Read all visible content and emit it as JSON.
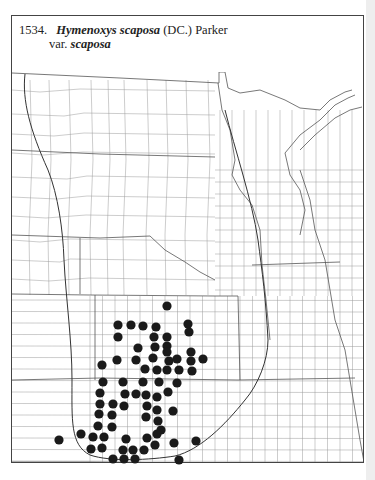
{
  "caption": {
    "number": "1534.",
    "genus": "Hymenoxys",
    "epithet": "scaposa",
    "authority": "(DC.) Parker",
    "rank": "var.",
    "infraspecific": "scaposa"
  },
  "colors": {
    "ink": "#222222",
    "county_line": "#9a9a9a",
    "state_line": "#555555",
    "range_line": "#333333",
    "dot": "#1a1a1a",
    "gutter": "#eeeeee"
  },
  "map": {
    "frame": {
      "x": 11,
      "y": 15,
      "width": 353,
      "height": 448
    },
    "dot_radius": 4.6,
    "occurrence_dots": [
      [
        167,
        306
      ],
      [
        118,
        325
      ],
      [
        131,
        325
      ],
      [
        143,
        326
      ],
      [
        156,
        327
      ],
      [
        188,
        324
      ],
      [
        189,
        332
      ],
      [
        118,
        337
      ],
      [
        154,
        337
      ],
      [
        167,
        337
      ],
      [
        138,
        348
      ],
      [
        155,
        347
      ],
      [
        167,
        346
      ],
      [
        167,
        352
      ],
      [
        191,
        352
      ],
      [
        117,
        360
      ],
      [
        136,
        360
      ],
      [
        153,
        358
      ],
      [
        169,
        361
      ],
      [
        177,
        359
      ],
      [
        191,
        361
      ],
      [
        203,
        359
      ],
      [
        102,
        365
      ],
      [
        145,
        369
      ],
      [
        157,
        370
      ],
      [
        167,
        370
      ],
      [
        179,
        370
      ],
      [
        192,
        371
      ],
      [
        103,
        382
      ],
      [
        123,
        382
      ],
      [
        143,
        382
      ],
      [
        159,
        382
      ],
      [
        177,
        383
      ],
      [
        100,
        393
      ],
      [
        125,
        394
      ],
      [
        136,
        394
      ],
      [
        146,
        395
      ],
      [
        157,
        397
      ],
      [
        168,
        392
      ],
      [
        100,
        404
      ],
      [
        113,
        404
      ],
      [
        124,
        406
      ],
      [
        147,
        406
      ],
      [
        157,
        410
      ],
      [
        173,
        411
      ],
      [
        99,
        414
      ],
      [
        112,
        415
      ],
      [
        146,
        417
      ],
      [
        158,
        421
      ],
      [
        98,
        426
      ],
      [
        112,
        427
      ],
      [
        161,
        430
      ],
      [
        157,
        434
      ],
      [
        59,
        440
      ],
      [
        81,
        434
      ],
      [
        93,
        437
      ],
      [
        104,
        437
      ],
      [
        126,
        439
      ],
      [
        147,
        438
      ],
      [
        174,
        443
      ],
      [
        196,
        441
      ],
      [
        155,
        445
      ],
      [
        91,
        449
      ],
      [
        102,
        448
      ],
      [
        123,
        450
      ],
      [
        133,
        450
      ],
      [
        144,
        450
      ],
      [
        113,
        459
      ],
      [
        124,
        459
      ],
      [
        135,
        459
      ],
      [
        179,
        460
      ]
    ]
  }
}
